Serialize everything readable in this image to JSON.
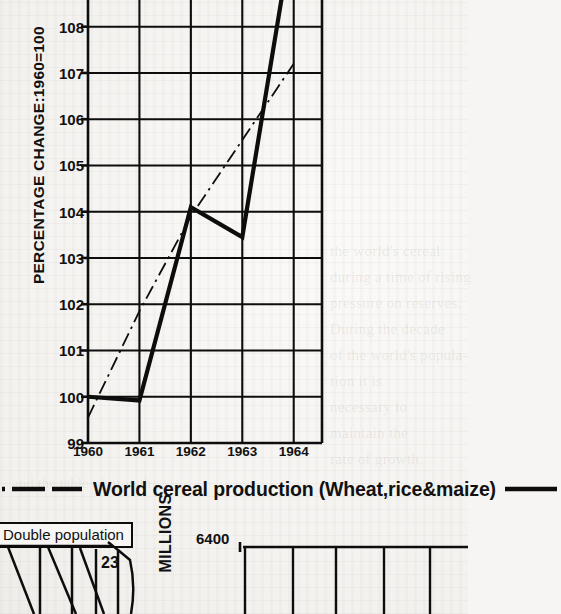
{
  "page": {
    "background_color": "#f6f5f3",
    "ink_color": "#0d0d0d",
    "ghost_text": "the world's cereal\nduring a time of rising\npressure on reserves.\nDuring the decade\nof the world's popula-\ntion it is\nnecessary to\nmaintain the\nrate of growth.",
    "ghost_text_2": "and the table of growth"
  },
  "chart_data": {
    "type": "line",
    "title": "World cereal production (Wheat,rice&maize)",
    "xlabel": "",
    "ylabel": "PERCENTAGE CHANGE:1960=100",
    "x": [
      "1960",
      "1961",
      "1962",
      "1963",
      "1964"
    ],
    "xlim": [
      1960,
      1964.55
    ],
    "ylim": [
      99,
      108.75
    ],
    "yticks": [
      99,
      100,
      101,
      102,
      103,
      104,
      105,
      106,
      107,
      108
    ],
    "ytick_labels": [
      "99",
      "100",
      "101",
      "102",
      "103",
      "104",
      "105",
      "106",
      "107",
      "108"
    ],
    "grid": true,
    "grid_note": "horizontal rules at every integer 100-108; vertical rules at each year",
    "legend_position": "below-axis-caption",
    "series": [
      {
        "name": "World cereal production (Wheat,rice&maize)",
        "style": "solid",
        "linewidth": 4.2,
        "values": [
          100.0,
          99.92,
          104.1,
          103.45,
          110.2
        ],
        "note": "1964 segment runs off the top of the visible crop above 108.75"
      },
      {
        "name": "Trend",
        "style": "dash-dot",
        "linewidth": 1.8,
        "values": [
          99.55,
          101.85,
          103.9,
          105.55,
          107.2
        ]
      }
    ]
  },
  "caption": {
    "text": "World cereal production (Wheat,rice&maize)",
    "left_rule_style": "dash-dot",
    "right_rule_style": "solid"
  },
  "bottom_fragments": {
    "population_box_label": "Double population",
    "fan_value": "23",
    "axis_label": "MILLIONS",
    "axis_tick": "6400"
  }
}
